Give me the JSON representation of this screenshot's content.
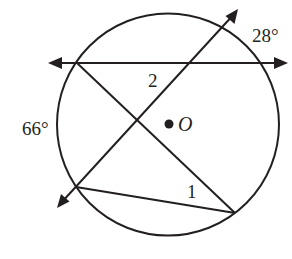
{
  "diagram": {
    "type": "circle-secants",
    "circle": {
      "center": [
        168,
        124
      ],
      "radius": 111,
      "center_label": "O"
    },
    "labels": {
      "arc_top_right": "28°",
      "arc_left": "66°",
      "angle_2": "2",
      "angle_1": "1",
      "center": "O"
    },
    "lines": [
      {
        "name": "horizontal-secant",
        "from": [
          50,
          63
        ],
        "to": [
          286,
          63
        ],
        "arrows": "both"
      },
      {
        "name": "diagonal-secant",
        "from": [
          58,
          206
        ],
        "to": [
          237,
          10
        ],
        "arrows": "both"
      },
      {
        "name": "chord-descending",
        "from": [
          77,
          63
        ],
        "to": [
          235,
          213
        ],
        "arrows": "none"
      },
      {
        "name": "chord-bottom",
        "from": [
          76,
          187
        ],
        "to": [
          235,
          213
        ],
        "arrows": "none"
      }
    ],
    "colors": {
      "stroke": "#231f20",
      "background": "#ffffff"
    }
  }
}
